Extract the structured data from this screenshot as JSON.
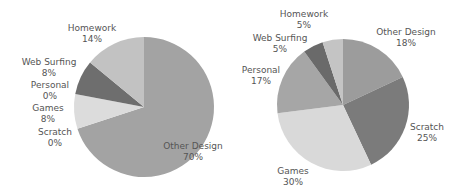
{
  "chart_data": [
    {
      "type": "pie",
      "title": "",
      "start_angle_deg": 0,
      "direction": "clockwise",
      "center": [
        144,
        107
      ],
      "radius": 70,
      "slices": [
        {
          "label": "Other Design",
          "value": 70,
          "display": "70%",
          "color": "#a3a3a3",
          "label_pos": [
            193,
            149
          ],
          "anchor": "middle"
        },
        {
          "label": "Scratch",
          "value": 0,
          "display": "0%",
          "color": "#7a7a7a",
          "label_pos": [
            55,
            135
          ],
          "anchor": "middle"
        },
        {
          "label": "Games",
          "value": 8,
          "display": "8%",
          "color": "#dcdcdc",
          "label_pos": [
            48,
            111
          ],
          "anchor": "middle"
        },
        {
          "label": "Personal",
          "value": 0,
          "display": "0%",
          "color": "#9a9a9a",
          "label_pos": [
            50,
            88
          ],
          "anchor": "middle"
        },
        {
          "label": "Web Surfing",
          "value": 8,
          "display": "8%",
          "color": "#6e6e6e",
          "label_pos": [
            49,
            65
          ],
          "anchor": "middle"
        },
        {
          "label": "Homework",
          "value": 14,
          "display": "14%",
          "color": "#c2c2c2",
          "label_pos": [
            92,
            31
          ],
          "anchor": "middle"
        }
      ]
    },
    {
      "type": "pie",
      "title": "",
      "start_angle_deg": 0,
      "direction": "clockwise",
      "center": [
        343,
        105
      ],
      "radius": 66,
      "slices": [
        {
          "label": "Other Design",
          "value": 18,
          "display": "18%",
          "color": "#9c9c9c",
          "label_pos": [
            406,
            35
          ],
          "anchor": "middle"
        },
        {
          "label": "Scratch",
          "value": 25,
          "display": "25%",
          "color": "#7b7b7b",
          "label_pos": [
            427,
            130
          ],
          "anchor": "middle"
        },
        {
          "label": "Games",
          "value": 30,
          "display": "30%",
          "color": "#d9d9d9",
          "label_pos": [
            293,
            174
          ],
          "anchor": "middle"
        },
        {
          "label": "Personal",
          "value": 17,
          "display": "17%",
          "color": "#a6a6a6",
          "label_pos": [
            261,
            73
          ],
          "anchor": "middle"
        },
        {
          "label": "Web Surfing",
          "value": 5,
          "display": "5%",
          "color": "#6a6a6a",
          "label_pos": [
            280,
            41
          ],
          "anchor": "middle"
        },
        {
          "label": "Homework",
          "value": 5,
          "display": "5%",
          "color": "#c4c4c4",
          "label_pos": [
            304,
            17
          ],
          "anchor": "middle"
        }
      ]
    }
  ]
}
